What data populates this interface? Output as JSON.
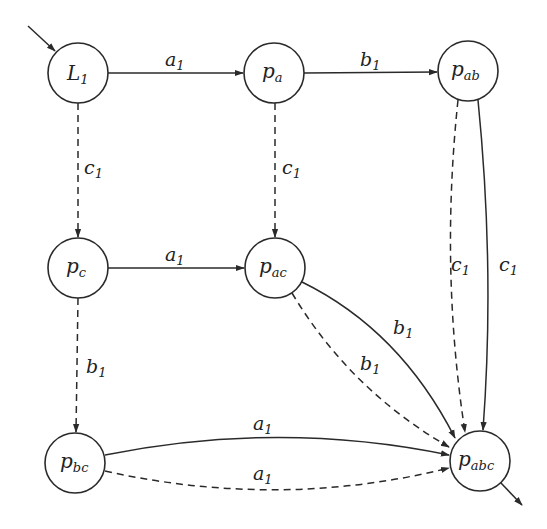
{
  "diagram": {
    "type": "automaton",
    "colors": {
      "stroke": "#2a2a2a",
      "background": "#ffffff"
    },
    "nodes": [
      {
        "id": "L1",
        "base": "L",
        "sub": "1",
        "x": 78,
        "y": 73,
        "initial": true
      },
      {
        "id": "pa",
        "base": "p",
        "sub": "a",
        "x": 274,
        "y": 73
      },
      {
        "id": "pab",
        "base": "p",
        "sub": "ab",
        "x": 468,
        "y": 71
      },
      {
        "id": "pc",
        "base": "p",
        "sub": "c",
        "x": 78,
        "y": 268
      },
      {
        "id": "pac",
        "base": "p",
        "sub": "ac",
        "x": 275,
        "y": 268
      },
      {
        "id": "pbc",
        "base": "p",
        "sub": "bc",
        "x": 75,
        "y": 463
      },
      {
        "id": "pabc",
        "base": "p",
        "sub": "abc",
        "x": 480,
        "y": 461,
        "final": true
      }
    ],
    "edges": [
      {
        "from": "L1",
        "to": "pa",
        "label": "a",
        "sub": "1",
        "style": "solid"
      },
      {
        "from": "pa",
        "to": "pab",
        "label": "b",
        "sub": "1",
        "style": "solid"
      },
      {
        "from": "L1",
        "to": "pc",
        "label": "c",
        "sub": "1",
        "style": "dashed"
      },
      {
        "from": "pa",
        "to": "pac",
        "label": "c",
        "sub": "1",
        "style": "dashed"
      },
      {
        "from": "pc",
        "to": "pac",
        "label": "a",
        "sub": "1",
        "style": "solid"
      },
      {
        "from": "pc",
        "to": "pbc",
        "label": "b",
        "sub": "1",
        "style": "dashed"
      },
      {
        "from": "pab",
        "to": "pabc",
        "label": "c",
        "sub": "1",
        "style": "dashed"
      },
      {
        "from": "pab",
        "to": "pabc",
        "label": "c",
        "sub": "1",
        "style": "solid"
      },
      {
        "from": "pac",
        "to": "pabc",
        "label": "b",
        "sub": "1",
        "style": "solid"
      },
      {
        "from": "pac",
        "to": "pabc",
        "label": "b",
        "sub": "1",
        "style": "dashed"
      },
      {
        "from": "pbc",
        "to": "pabc",
        "label": "a",
        "sub": "1",
        "style": "solid"
      },
      {
        "from": "pbc",
        "to": "pabc",
        "label": "a",
        "sub": "1",
        "style": "dashed"
      }
    ]
  },
  "labels": {
    "L1": {
      "base": "L",
      "sub": "1"
    },
    "pa": {
      "base": "p",
      "sub": "a"
    },
    "pab": {
      "base": "p",
      "sub": "ab"
    },
    "pc": {
      "base": "p",
      "sub": "c"
    },
    "pac": {
      "base": "p",
      "sub": "ac"
    },
    "pbc": {
      "base": "p",
      "sub": "bc"
    },
    "pabc": {
      "base": "p",
      "sub": "abc"
    },
    "e_L1_pa": {
      "base": "a",
      "sub": "1"
    },
    "e_pa_pab": {
      "base": "b",
      "sub": "1"
    },
    "e_L1_pc": {
      "base": "c",
      "sub": "1"
    },
    "e_pa_pac": {
      "base": "c",
      "sub": "1"
    },
    "e_pc_pac": {
      "base": "a",
      "sub": "1"
    },
    "e_pc_pbc": {
      "base": "b",
      "sub": "1"
    },
    "e_pab_pabc_dashed": {
      "base": "c",
      "sub": "1"
    },
    "e_pab_pabc_solid": {
      "base": "c",
      "sub": "1"
    },
    "e_pac_pabc_solid": {
      "base": "b",
      "sub": "1"
    },
    "e_pac_pabc_dashed": {
      "base": "b",
      "sub": "1"
    },
    "e_pbc_pabc_solid": {
      "base": "a",
      "sub": "1"
    },
    "e_pbc_pabc_dashed": {
      "base": "a",
      "sub": "1"
    }
  }
}
